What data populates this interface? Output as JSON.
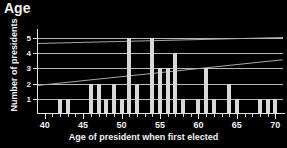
{
  "chart_data": {
    "type": "bar",
    "title": "Age",
    "xlabel": "Age of president when first elected",
    "ylabel": "Number of presidents",
    "xlim": [
      39,
      71
    ],
    "ylim": [
      0,
      5.6
    ],
    "xticks": [
      40,
      45,
      50,
      55,
      60,
      65,
      70
    ],
    "yticks": [
      1,
      2,
      3,
      4,
      5
    ],
    "grid": true,
    "legend": "none",
    "categories": [
      42,
      43,
      46,
      47,
      48,
      49,
      50,
      51,
      52,
      54,
      55,
      56,
      57,
      58,
      60,
      61,
      62,
      64,
      65,
      68,
      69,
      70
    ],
    "values": [
      1,
      1,
      2,
      2,
      1,
      2,
      1,
      5,
      2,
      5,
      3,
      3,
      4,
      1,
      1,
      3,
      1,
      2,
      1,
      1,
      1,
      1
    ],
    "annotations": [
      {
        "name": "trend-line-upper",
        "x0": 39,
        "y0": 4.7,
        "x1": 71,
        "y1": 5.1
      },
      {
        "name": "trend-line-lower",
        "x0": 39,
        "y0": 1.9,
        "x1": 71,
        "y1": 3.6
      }
    ],
    "colors": {
      "background": "#000000",
      "bar": "#d8d8d8",
      "grid": "#b9b9b9",
      "axis": "#e6e6e6",
      "text": "#f5f5f5"
    }
  }
}
